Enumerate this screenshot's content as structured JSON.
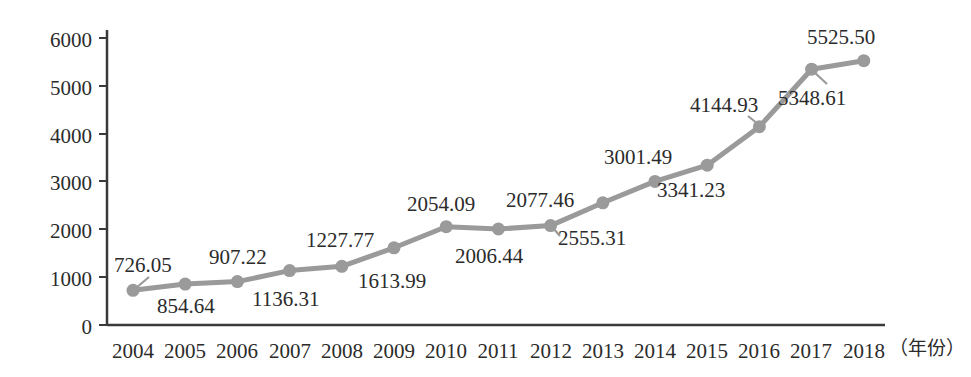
{
  "chart_data": {
    "type": "line",
    "title": "",
    "xlabel": "（年份）",
    "ylabel": "",
    "categories": [
      "2004",
      "2005",
      "2006",
      "2007",
      "2008",
      "2009",
      "2010",
      "2011",
      "2012",
      "2013",
      "2014",
      "2015",
      "2016",
      "2017",
      "2018"
    ],
    "values": [
      726.05,
      854.64,
      907.22,
      1136.31,
      1227.77,
      1613.99,
      2054.09,
      2006.44,
      2077.46,
      2555.31,
      3001.49,
      3341.23,
      4144.93,
      5348.61,
      5525.5
    ],
    "data_labels": [
      "726.05",
      "854.64",
      "907.22",
      "1136.31",
      "1227.77",
      "1613.99",
      "2054.09",
      "2006.44",
      "2077.46",
      "2555.31",
      "3001.49",
      "3341.23",
      "4144.93",
      "5348.61",
      "5525.50"
    ],
    "ylim": [
      0,
      6000
    ],
    "y_ticks": [
      0,
      1000,
      2000,
      3000,
      4000,
      5000,
      6000
    ],
    "y_tick_labels": [
      "0",
      "1000",
      "2000",
      "3000",
      "4000",
      "5000",
      "6000"
    ],
    "grid": false,
    "legend": null,
    "series": [
      {
        "name": "",
        "color": "#9a9a9a",
        "values": [
          726.05,
          854.64,
          907.22,
          1136.31,
          1227.77,
          1613.99,
          2054.09,
          2006.44,
          2077.46,
          2555.31,
          3001.49,
          3341.23,
          4144.93,
          5348.61,
          5525.5
        ]
      }
    ],
    "label_placement": [
      "above",
      "below",
      "above",
      "below",
      "above",
      "below",
      "above",
      "below",
      "above",
      "below",
      "above",
      "below",
      "above",
      "below",
      "above"
    ],
    "colors": {
      "line": "#9a9a9a",
      "marker": "#9a9a9a",
      "axis": "#3a3a3a",
      "text": "#2b2b2b",
      "background": "#ffffff"
    }
  }
}
